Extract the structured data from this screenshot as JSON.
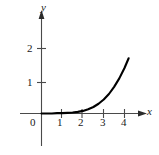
{
  "figure": {
    "title": "",
    "background_color": "#ffffff",
    "ink_color": "#1a1a1a"
  },
  "axes": {
    "x_name": "x",
    "y_name": "y",
    "origin_label": "0"
  },
  "chart_data": {
    "type": "line",
    "title": "",
    "xlabel": "x",
    "ylabel": "y",
    "grid": false,
    "legend": null,
    "xlim": [
      -0.35,
      5.2
    ],
    "ylim": [
      -1.0,
      2.5
    ],
    "xticks": [
      1,
      2,
      3,
      4
    ],
    "xtick_labels": [
      "1",
      "2",
      "3",
      "4"
    ],
    "yticks": [
      1,
      2
    ],
    "ytick_labels": [
      "1",
      "2"
    ],
    "origin_tick_label": "0",
    "series": [
      {
        "name": "curve",
        "x": [
          0.0,
          0.25,
          0.5,
          0.75,
          1.0,
          1.25,
          1.5,
          1.75,
          2.0,
          2.25,
          2.5,
          2.75,
          3.0,
          3.25,
          3.5,
          3.75,
          4.0,
          4.2
        ],
        "y": [
          0.0,
          0.0,
          0.0,
          0.01,
          0.01,
          0.02,
          0.03,
          0.05,
          0.08,
          0.13,
          0.2,
          0.3,
          0.43,
          0.6,
          0.82,
          1.08,
          1.4,
          1.7
        ]
      }
    ]
  }
}
